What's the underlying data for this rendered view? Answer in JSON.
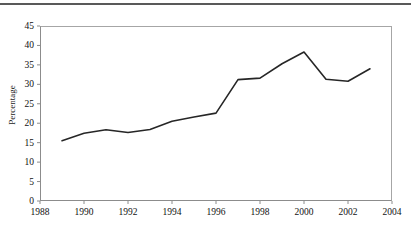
{
  "chart_data": {
    "type": "line",
    "title": "",
    "xlabel": "",
    "ylabel": "Percentage",
    "xlim": [
      1988,
      2004
    ],
    "ylim": [
      0,
      45
    ],
    "grid": false,
    "legend": null,
    "legend_position": "none",
    "x_tick_labels": [
      "1988",
      "1990",
      "1992",
      "1994",
      "1996",
      "1998",
      "2000",
      "2002",
      "2004"
    ],
    "x_ticks": [
      1988,
      1990,
      1992,
      1994,
      1996,
      1998,
      2000,
      2002,
      2004
    ],
    "y_tick_labels": [
      "0",
      "5",
      "10",
      "15",
      "20",
      "25",
      "30",
      "35",
      "40",
      "45"
    ],
    "y_ticks": [
      0,
      5,
      10,
      15,
      20,
      25,
      30,
      35,
      40,
      45
    ],
    "x": [
      1989,
      1990,
      1991,
      1992,
      1993,
      1994,
      1995,
      1996,
      1997,
      1998,
      1999,
      2000,
      2001,
      2002,
      2003
    ],
    "values": [
      15.5,
      17.4,
      18.3,
      17.6,
      18.4,
      20.5,
      21.6,
      22.6,
      31.2,
      31.6,
      35.3,
      38.3,
      31.3,
      30.8,
      34.0
    ],
    "series": [
      {
        "name": "Percentage",
        "values": [
          15.5,
          17.4,
          18.3,
          17.6,
          18.4,
          20.5,
          21.6,
          22.6,
          31.2,
          31.6,
          35.3,
          38.3,
          31.3,
          30.8,
          34.0
        ]
      }
    ],
    "line_color": "#262626",
    "frame_color": "#8c8c8c",
    "rule_color": "#595959"
  }
}
